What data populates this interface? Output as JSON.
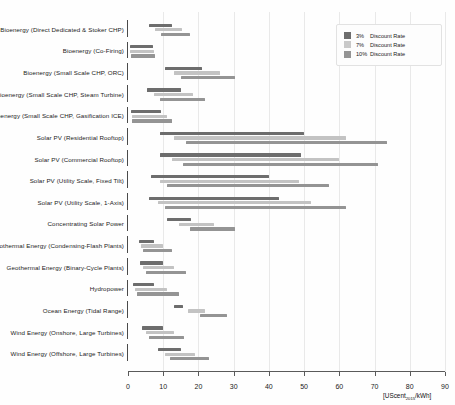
{
  "chart_data": {
    "type": "bar",
    "title": "",
    "subtitle": "",
    "xlabel": "[UScent2015/kWh]",
    "xlabel_main": "[UScent",
    "xlabel_sub": "2015",
    "xlabel_tail": "/kWh]",
    "ylabel": "",
    "xlim": [
      0,
      90
    ],
    "xticks": [
      0,
      10,
      20,
      30,
      40,
      50,
      60,
      70,
      80,
      90
    ],
    "xtick_labels": [
      "0",
      "10",
      "20",
      "30",
      "40",
      "50",
      "60",
      "70",
      "80",
      "90"
    ],
    "grid": true,
    "orientation": "horizontal",
    "legend_position": "top-right",
    "series": [
      {
        "name": "3%",
        "label": "3%  Discount Rate",
        "color": "#6d6d6d",
        "key": "r3"
      },
      {
        "name": "7%",
        "label": "7%  Discount Rate",
        "color": "#c9c9c9",
        "key": "r7"
      },
      {
        "name": "10%",
        "label": "10%  Discount Rate",
        "color": "#949494",
        "key": "r10"
      }
    ],
    "categories": [
      "Bioenergy (Direct Dedicated & Stoker CHP)",
      "Bioenergy (Co-Firing)",
      "Bioenergy (Small Scale CHP, ORC)",
      "Bioenergy (Small Scale CHP, Steam Turbine)",
      "Bioenergy (Small Scale CHP, Gasification ICE)",
      "Solar PV (Residential Rooftop)",
      "Solar PV (Commercial Rooftop)",
      "Solar PV (Utility Scale, Fixed Tilt)",
      "Solar PV (Utility Scale, 1-Axis)",
      "Concentrating Solar Power",
      "Geothermal Energy (Condensing-Flash Plants)",
      "Geothermal Energy (Binary-Cycle Plants)",
      "Hydropower",
      "Ocean Energy (Tidal Range)",
      "Wind Energy (Onshore, Large Turbines)",
      "Wind Energy (Offshore, Large Turbines)"
    ],
    "ranges": [
      {
        "category": "Bioenergy (Direct Dedicated & Stoker CHP)",
        "r3": [
          6.0,
          12.6
        ],
        "r7": [
          7.7,
          15.2
        ],
        "r10": [
          9.3,
          17.6
        ]
      },
      {
        "category": "Bioenergy (Co-Firing)",
        "r3": [
          0.6,
          7.2
        ],
        "r7": [
          0.7,
          7.5
        ],
        "r10": [
          0.8,
          7.8
        ]
      },
      {
        "category": "Bioenergy (Small Scale CHP, ORC)",
        "r3": [
          10.5,
          21.0
        ],
        "r7": [
          13.0,
          26.0
        ],
        "r10": [
          15.0,
          30.5
        ]
      },
      {
        "category": "Bioenergy (Small Scale CHP, Steam Turbine)",
        "r3": [
          5.5,
          15.0
        ],
        "r7": [
          7.5,
          18.5
        ],
        "r10": [
          9.0,
          22.0
        ]
      },
      {
        "category": "Bioenergy (Small Scale CHP, Gasification ICE)",
        "r3": [
          0.8,
          9.5
        ],
        "r7": [
          1.0,
          11.0
        ],
        "r10": [
          1.2,
          12.5
        ]
      },
      {
        "category": "Solar PV (Residential Rooftop)",
        "r3": [
          9.0,
          50.0
        ],
        "r7": [
          13.0,
          62.0
        ],
        "r10": [
          16.5,
          73.5
        ]
      },
      {
        "category": "Solar PV (Commercial Rooftop)",
        "r3": [
          9.0,
          49.0
        ],
        "r7": [
          12.5,
          60.0
        ],
        "r10": [
          15.5,
          71.0
        ]
      },
      {
        "category": "Solar PV (Utility Scale, Fixed Tilt)",
        "r3": [
          6.5,
          40.0
        ],
        "r7": [
          9.0,
          48.5
        ],
        "r10": [
          11.0,
          57.0
        ]
      },
      {
        "category": "Solar PV (Utility Scale, 1-Axis)",
        "r3": [
          6.0,
          43.0
        ],
        "r7": [
          8.5,
          52.0
        ],
        "r10": [
          10.5,
          62.0
        ]
      },
      {
        "category": "Concentrating Solar Power",
        "r3": [
          11.0,
          18.0
        ],
        "r7": [
          14.5,
          24.5
        ],
        "r10": [
          17.5,
          30.5
        ]
      },
      {
        "category": "Geothermal Energy (Condensing-Flash Plants)",
        "r3": [
          3.0,
          7.5
        ],
        "r7": [
          3.7,
          10.0
        ],
        "r10": [
          4.3,
          12.5
        ]
      },
      {
        "category": "Geothermal Energy (Binary-Cycle Plants)",
        "r3": [
          3.5,
          10.0
        ],
        "r7": [
          4.3,
          13.0
        ],
        "r10": [
          5.0,
          16.5
        ]
      },
      {
        "category": "Hydropower",
        "r3": [
          1.5,
          7.5
        ],
        "r7": [
          2.0,
          11.0
        ],
        "r10": [
          2.5,
          14.5
        ]
      },
      {
        "category": "Ocean Energy (Tidal Range)",
        "r3": [
          13.0,
          15.5
        ],
        "r7": [
          17.0,
          22.0
        ],
        "r10": [
          20.5,
          28.0
        ]
      },
      {
        "category": "Wind Energy (Onshore, Large Turbines)",
        "r3": [
          4.0,
          10.0
        ],
        "r7": [
          5.0,
          13.0
        ],
        "r10": [
          6.0,
          16.0
        ]
      },
      {
        "category": "Wind Energy (Offshore, Large Turbines)",
        "r3": [
          8.5,
          15.0
        ],
        "r7": [
          10.5,
          19.0
        ],
        "r10": [
          12.0,
          23.0
        ]
      }
    ]
  },
  "legend": {
    "rows": [
      {
        "pct": "3%",
        "text": "Discount Rate"
      },
      {
        "pct": "7%",
        "text": "Discount Rate"
      },
      {
        "pct": "10%",
        "text": "Discount Rate"
      }
    ]
  }
}
